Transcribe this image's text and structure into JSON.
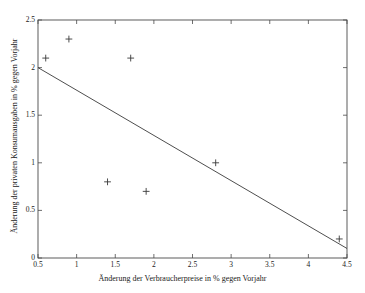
{
  "chart_data": {
    "type": "scatter",
    "title": "",
    "xlabel": "Änderung der Verbraucherpreise in % gegen Vorjahr",
    "ylabel": "Änderung der privaten Konsumausgaben in % gegen Vorjahr",
    "xlim": [
      0.5,
      4.5
    ],
    "ylim": [
      0,
      2.5
    ],
    "xticks": [
      0.5,
      1,
      1.5,
      2,
      2.5,
      3,
      3.5,
      4,
      4.5
    ],
    "xticklabels": [
      "0.5",
      "1",
      "1.5",
      "2",
      "2.5",
      "3",
      "3.5",
      "4",
      "4.5"
    ],
    "yticks": [
      0,
      0.5,
      1,
      1.5,
      2,
      2.5
    ],
    "yticklabels": [
      "0",
      "0.5",
      "1",
      "1.5",
      "2",
      "2.5"
    ],
    "grid": false,
    "legend": null,
    "marker": "+",
    "marker_color": "#3a3a3a",
    "line_color": "#3a3a3a",
    "axis_color": "#4a4a4a",
    "background": "#ffffff",
    "points": [
      {
        "x": 0.6,
        "y": 2.1
      },
      {
        "x": 0.9,
        "y": 2.3
      },
      {
        "x": 1.7,
        "y": 2.1
      },
      {
        "x": 1.4,
        "y": 0.8
      },
      {
        "x": 1.9,
        "y": 0.7
      },
      {
        "x": 2.8,
        "y": 1.0
      },
      {
        "x": 4.4,
        "y": 0.2
      }
    ],
    "series": [
      {
        "name": "Beobachtungen",
        "type": "scatter",
        "x": [
          0.6,
          0.9,
          1.7,
          1.4,
          1.9,
          2.8,
          4.4
        ],
        "values": [
          2.1,
          2.3,
          2.1,
          0.8,
          0.7,
          1.0,
          0.2
        ]
      },
      {
        "name": "Regressionsgerade",
        "type": "line",
        "x": [
          0.5,
          4.5
        ],
        "values": [
          2.0,
          0.1
        ]
      }
    ],
    "regression_line": {
      "x_start": 0.5,
      "y_start": 2.0,
      "x_end": 4.5,
      "y_end": 0.1
    },
    "annotations": []
  }
}
